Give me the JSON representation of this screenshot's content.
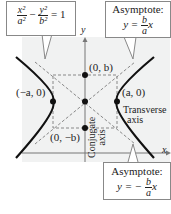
{
  "equation_callout": {
    "lhs_term1_num": "x²",
    "lhs_term1_den": "a²",
    "minus": "−",
    "lhs_term2_num": "y²",
    "lhs_term2_den": "b²",
    "rhs": "= 1"
  },
  "asymptote_pos": {
    "title": "Asymptote:",
    "prefix": "y =",
    "num": "b",
    "den": "a",
    "suffix": "x"
  },
  "asymptote_neg": {
    "title": "Asymptote:",
    "prefix": "y = −",
    "num": "b",
    "den": "a",
    "suffix": "x"
  },
  "axes": {
    "x_label": "x",
    "y_label": "y"
  },
  "points": {
    "vertex_left": "(−a, 0)",
    "vertex_right": "(a, 0)",
    "co_vertex_top": "(0, b)",
    "co_vertex_bottom": "(0, −b)"
  },
  "axis_labels": {
    "transverse_line1": "Transverse",
    "transverse_line2": "axis",
    "conjugate_line1": "Conjugate",
    "conjugate_line2": "axis"
  },
  "colors": {
    "background_panel": "#f1f2f2",
    "curve": "#111111",
    "dashed": "#888888",
    "axis": "#777777"
  }
}
